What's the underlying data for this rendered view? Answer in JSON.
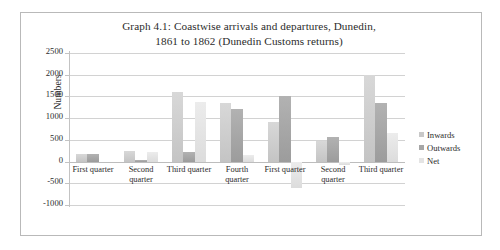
{
  "figure": {
    "border_color": "#b9b9b9",
    "background": "#ffffff"
  },
  "chart_data": {
    "type": "bar",
    "title": "Graph 4.1: Coastwise arrivals and departures, Dunedin, 1861 to 1862 (Dunedin Customs returns)",
    "title_line_1": "Graph 4.1: Coastwise arrivals and departures, Dunedin,",
    "title_line_2": "1861 to 1862 (Dunedin Customs returns)",
    "xlabel": "",
    "ylabel": "Numbers",
    "ylim": [
      -1000,
      2500
    ],
    "ytick_step": 500,
    "yticks": [
      2500,
      2000,
      1500,
      1000,
      500,
      0,
      -500,
      -1000
    ],
    "ytick_labels": [
      "2500",
      "2000",
      "1500",
      "1000",
      "500",
      "0",
      "-500",
      "-1000"
    ],
    "grid": true,
    "grid_axis": "y",
    "legend_position": "right",
    "categories": [
      "First quarter",
      "Second quarter",
      "Third quarter",
      "Fourth quarter",
      "First quarter",
      "Second quarter",
      "Third quarter"
    ],
    "series": [
      {
        "name": "Inwards",
        "color": "#c8c8c8",
        "values": [
          170,
          250,
          1600,
          1350,
          900,
          480,
          2000
        ]
      },
      {
        "name": "Outwards",
        "color": "#a6a6a6",
        "values": [
          170,
          30,
          230,
          1200,
          1500,
          560,
          1350
        ]
      },
      {
        "name": "Net",
        "color": "#e4e4e4",
        "values": [
          0,
          220,
          1370,
          150,
          -600,
          -80,
          650
        ]
      }
    ]
  }
}
